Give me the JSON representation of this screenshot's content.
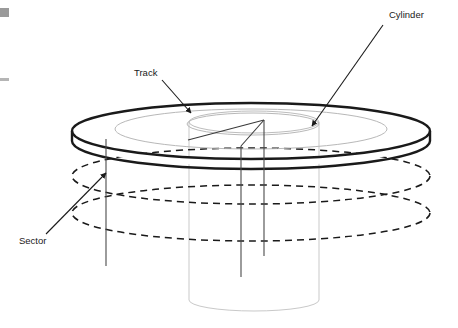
{
  "figure": {
    "kind": "disk-storage-geometry-diagram",
    "background_color": "#ffffff"
  },
  "labels": {
    "cylinder": "Cylinder",
    "track": "Track",
    "sector": "Sector"
  },
  "colors": {
    "outline_dark": "#1a1a1a",
    "inner_track_gray": "#b8b8b8",
    "cylinder_gray": "#c9c9c9",
    "leader_line": "#2b2b2b",
    "artifact_gray": "#9a9a9a",
    "text": "#1a1a1a"
  },
  "geometry": {
    "platter": {
      "center_x": 251,
      "center_y": 131,
      "radius_x": 179,
      "radius_y": 28,
      "stroke_width": 2.4,
      "thickness": 14
    },
    "inner_tracks": [
      {
        "radius_x": 136,
        "radius_y": 20
      },
      {
        "radius_x": 66,
        "radius_y": 11
      }
    ],
    "cylinder": {
      "top_center_x": 254,
      "top_center_y": 122,
      "radius_x": 65,
      "radius_y": 11,
      "bottom_center_y": 300,
      "stroke_width": 1
    },
    "dashed_ellipses": [
      {
        "center_y": 176,
        "radius_x": 179,
        "radius_y": 28
      },
      {
        "center_y": 213,
        "radius_x": 179,
        "radius_y": 28
      }
    ],
    "sector_vertical_lines": [
      {
        "x": 106,
        "y_top": 139,
        "y_bottom": 266
      },
      {
        "x": 241,
        "y_top": 122,
        "y_bottom": 277
      },
      {
        "x": 264,
        "y_top": 120,
        "y_bottom": 256
      }
    ]
  },
  "annotations": [
    {
      "name": "cylinder-annotation",
      "label": "Cylinder",
      "text_x": 389,
      "text_y": 18,
      "leader_from": [
        383,
        24
      ],
      "leader_to": [
        310,
        128
      ]
    },
    {
      "name": "track-annotation",
      "label": "Track",
      "text_x": 134,
      "text_y": 76,
      "leader_from": [
        163,
        80
      ],
      "leader_to": [
        190,
        112
      ]
    },
    {
      "name": "sector-annotation",
      "label": "Sector",
      "text_x": 19,
      "text_y": 244,
      "leader_from": [
        48,
        236
      ],
      "leader_to": [
        107,
        172
      ]
    }
  ],
  "edge_artifacts": [
    {
      "x": 0,
      "y": 8,
      "width": 9,
      "height": 9
    },
    {
      "x": 0,
      "y": 78,
      "width": 9,
      "height": 3
    }
  ]
}
